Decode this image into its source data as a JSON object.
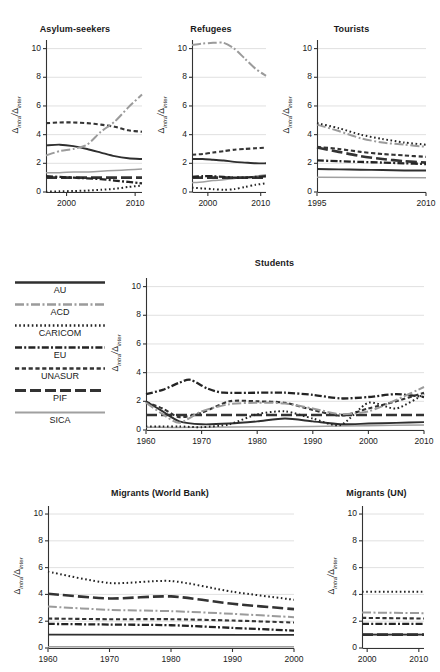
{
  "figure": {
    "ylabel_text": "Δintra/Δinter",
    "ylabel_num": "Δ",
    "ylabel_num_sub": "intra",
    "ylabel_den": "Δ",
    "ylabel_den_sub": "inter",
    "ylabel_slash": "/"
  },
  "legend": {
    "position": "left-middle",
    "items": [
      {
        "label": "AU",
        "style": "solid-dark",
        "color": "#2b2b2b"
      },
      {
        "label": "ACD",
        "style": "dashdot-gray",
        "color": "#9a9a9a"
      },
      {
        "label": "CARICOM",
        "style": "dotted",
        "color": "#2b2b2b"
      },
      {
        "label": "EU",
        "style": "dashdot-dark",
        "color": "#2b2b2b"
      },
      {
        "label": "UNASUR",
        "style": "dashed",
        "color": "#3a3a3a"
      },
      {
        "label": "PIF",
        "style": "longdash",
        "color": "#3a3a3a"
      },
      {
        "label": "SICA",
        "style": "solid-gray",
        "color": "#9a9a9a"
      }
    ]
  },
  "yticks": [
    "0",
    "2",
    "4",
    "6",
    "8",
    "10"
  ],
  "chart_data": [
    {
      "id": "asylum-seekers",
      "type": "line",
      "title": "Asylum-seekers",
      "xlabel": "",
      "ylabel": "Δintra/Δinter",
      "xlim": [
        1997,
        2011
      ],
      "ylim": [
        0,
        10.6
      ],
      "xticks": [
        "2000",
        "2010"
      ],
      "xtick_values": [
        2000,
        2010
      ],
      "yticks": [
        0,
        2,
        4,
        6,
        8,
        10
      ],
      "grid": true,
      "series": [
        {
          "name": "AU",
          "x": [
            1997,
            1999,
            2001,
            2003,
            2005,
            2007,
            2009,
            2011
          ],
          "values": [
            3.25,
            3.3,
            3.2,
            3.0,
            2.75,
            2.5,
            2.35,
            2.3
          ]
        },
        {
          "name": "ACD",
          "x": [
            1997,
            1999,
            2001,
            2003,
            2005,
            2007,
            2009,
            2011
          ],
          "values": [
            2.55,
            2.85,
            3.0,
            3.3,
            4.2,
            4.9,
            5.9,
            6.8
          ]
        },
        {
          "name": "CARICOM",
          "x": [
            1997,
            1999,
            2001,
            2003,
            2005,
            2007,
            2009,
            2011
          ],
          "values": [
            0.02,
            0.05,
            0.07,
            0.1,
            0.15,
            0.22,
            0.35,
            0.45
          ]
        },
        {
          "name": "EU",
          "x": [
            1997,
            1999,
            2001,
            2003,
            2005,
            2007,
            2009,
            2011
          ],
          "values": [
            1.1,
            1.05,
            1.0,
            0.95,
            0.9,
            0.8,
            0.7,
            0.6
          ]
        },
        {
          "name": "UNASUR",
          "x": [
            1997,
            1999,
            2001,
            2003,
            2005,
            2007,
            2009,
            2011
          ],
          "values": [
            4.8,
            4.85,
            4.85,
            4.8,
            4.7,
            4.55,
            4.3,
            4.2
          ]
        },
        {
          "name": "PIF",
          "x": [
            1997,
            2011
          ],
          "values": [
            1.0,
            1.0
          ]
        },
        {
          "name": "SICA",
          "x": [
            1997,
            1999,
            2001,
            2003,
            2005,
            2007,
            2009,
            2011
          ],
          "values": [
            1.35,
            1.35,
            1.4,
            1.4,
            1.45,
            1.5,
            1.55,
            1.6
          ]
        }
      ]
    },
    {
      "id": "refugees",
      "type": "line",
      "title": "Refugees",
      "xlabel": "",
      "ylabel": "Δintra/Δinter",
      "xlim": [
        1997,
        2011
      ],
      "ylim": [
        0,
        10.6
      ],
      "xticks": [
        "2000",
        "2010"
      ],
      "xtick_values": [
        2000,
        2010
      ],
      "yticks": [
        0,
        2,
        4,
        6,
        8,
        10
      ],
      "grid": true,
      "series": [
        {
          "name": "AU",
          "x": [
            1997,
            1999,
            2001,
            2003,
            2005,
            2007,
            2009,
            2011
          ],
          "values": [
            2.3,
            2.3,
            2.25,
            2.2,
            2.1,
            2.05,
            2.0,
            2.0
          ]
        },
        {
          "name": "ACD",
          "x": [
            1997,
            1999,
            2001,
            2003,
            2005,
            2007,
            2009,
            2011
          ],
          "values": [
            10.25,
            10.35,
            10.4,
            10.4,
            10.0,
            9.3,
            8.6,
            8.1
          ]
        },
        {
          "name": "CARICOM",
          "x": [
            1997,
            1999,
            2001,
            2003,
            2005,
            2007,
            2009,
            2011
          ],
          "values": [
            0.3,
            0.25,
            0.2,
            0.15,
            0.2,
            0.35,
            0.5,
            0.6
          ]
        },
        {
          "name": "EU",
          "x": [
            1997,
            1999,
            2001,
            2003,
            2005,
            2007,
            2009,
            2011
          ],
          "values": [
            1.05,
            1.1,
            1.1,
            1.05,
            1.0,
            1.0,
            1.05,
            1.1
          ]
        },
        {
          "name": "UNASUR",
          "x": [
            1997,
            1999,
            2001,
            2003,
            2005,
            2007,
            2009,
            2011
          ],
          "values": [
            2.6,
            2.65,
            2.75,
            2.85,
            2.95,
            3.0,
            3.05,
            3.1
          ]
        },
        {
          "name": "PIF",
          "x": [
            1997,
            2011
          ],
          "values": [
            1.0,
            1.0
          ]
        },
        {
          "name": "SICA",
          "x": [
            1997,
            1999,
            2001,
            2003,
            2005,
            2007,
            2009,
            2011
          ],
          "values": [
            0.65,
            0.7,
            0.8,
            0.85,
            0.95,
            1.0,
            1.1,
            1.2
          ]
        }
      ]
    },
    {
      "id": "tourists",
      "type": "line",
      "title": "Tourists",
      "xlabel": "",
      "ylabel": "Δintra/Δinter",
      "xlim": [
        1995,
        2010
      ],
      "ylim": [
        0,
        10.6
      ],
      "xticks": [
        "1995",
        "2010"
      ],
      "xtick_values": [
        1995,
        2010
      ],
      "yticks": [
        0,
        2,
        4,
        6,
        8,
        10
      ],
      "grid": true,
      "series": [
        {
          "name": "AU",
          "x": [
            1995,
            1998,
            2001,
            2004,
            2007,
            2010
          ],
          "values": [
            1.6,
            1.58,
            1.55,
            1.53,
            1.5,
            1.5
          ]
        },
        {
          "name": "ACD",
          "x": [
            1995,
            1998,
            2001,
            2004,
            2007,
            2010
          ],
          "values": [
            4.7,
            4.25,
            3.75,
            3.45,
            3.3,
            3.15
          ]
        },
        {
          "name": "CARICOM",
          "x": [
            1995,
            1998,
            2001,
            2004,
            2007,
            2010
          ],
          "values": [
            4.8,
            4.45,
            4.0,
            3.7,
            3.45,
            3.3
          ]
        },
        {
          "name": "EU",
          "x": [
            1995,
            1998,
            2001,
            2004,
            2007,
            2010
          ],
          "values": [
            2.2,
            2.15,
            2.1,
            2.05,
            2.0,
            1.95
          ]
        },
        {
          "name": "UNASUR",
          "x": [
            1995,
            1998,
            2001,
            2004,
            2007,
            2010
          ],
          "values": [
            3.15,
            3.0,
            2.8,
            2.65,
            2.55,
            2.45
          ]
        },
        {
          "name": "PIF",
          "x": [
            1995,
            1998,
            2001,
            2004,
            2007,
            2010
          ],
          "values": [
            3.1,
            2.8,
            2.5,
            2.3,
            2.15,
            2.05
          ]
        },
        {
          "name": "SICA",
          "x": [
            1995,
            2010
          ],
          "values": [
            1.02,
            1.0
          ]
        }
      ]
    },
    {
      "id": "students",
      "type": "line",
      "title": "Students",
      "xlabel": "",
      "ylabel": "Δintra/Δinter",
      "xlim": [
        1960,
        2010
      ],
      "ylim": [
        0,
        10.6
      ],
      "xticks": [
        "1960",
        "1970",
        "1980",
        "1990",
        "2000",
        "2010"
      ],
      "xtick_values": [
        1960,
        1970,
        1980,
        1990,
        2000,
        2010
      ],
      "yticks": [
        0,
        2,
        4,
        6,
        8,
        10
      ],
      "grid": true,
      "series": [
        {
          "name": "AU",
          "x": [
            1960,
            1963,
            1966,
            1970,
            1975,
            1980,
            1985,
            1990,
            1995,
            2000,
            2005,
            2010
          ],
          "values": [
            2.0,
            1.3,
            0.6,
            0.4,
            0.45,
            0.6,
            0.8,
            0.6,
            0.4,
            0.45,
            0.5,
            0.55
          ]
        },
        {
          "name": "ACD",
          "x": [
            1960,
            1963,
            1966,
            1970,
            1975,
            1980,
            1985,
            1990,
            1995,
            2000,
            2005,
            2010
          ],
          "values": [
            1.9,
            1.1,
            0.5,
            1.3,
            1.8,
            1.9,
            1.85,
            1.5,
            1.1,
            1.3,
            2.1,
            3.0
          ]
        },
        {
          "name": "CARICOM",
          "x": [
            1960,
            1963,
            1966,
            1970,
            1975,
            1980,
            1985,
            1990,
            1995,
            2000,
            2005,
            2010
          ],
          "values": [
            0.25,
            0.25,
            0.25,
            0.2,
            0.4,
            1.1,
            1.3,
            0.8,
            0.35,
            1.9,
            1.5,
            2.5
          ]
        },
        {
          "name": "EU",
          "x": [
            1960,
            1963,
            1966,
            1968,
            1971,
            1974,
            1980,
            1985,
            1990,
            1995,
            2000,
            2005,
            2010
          ],
          "values": [
            2.5,
            2.8,
            3.3,
            3.5,
            2.9,
            2.6,
            2.6,
            2.6,
            2.45,
            2.2,
            2.3,
            2.5,
            2.3
          ]
        },
        {
          "name": "UNASUR",
          "x": [
            1960,
            1963,
            1966,
            1970,
            1975,
            1980,
            1985,
            1990,
            1995,
            2000,
            2005,
            2010
          ],
          "values": [
            1.95,
            1.5,
            0.9,
            1.2,
            2.0,
            2.0,
            1.9,
            1.4,
            1.0,
            1.5,
            2.0,
            2.6
          ]
        },
        {
          "name": "PIF",
          "x": [
            1960,
            2010
          ],
          "values": [
            1.05,
            1.05
          ]
        },
        {
          "name": "SICA",
          "x": [
            1960,
            1965,
            1970,
            1980,
            1990,
            2000,
            2010
          ],
          "values": [
            0.2,
            0.18,
            0.2,
            0.22,
            0.25,
            0.3,
            0.35
          ]
        }
      ]
    },
    {
      "id": "migrants-world-bank",
      "type": "line",
      "title": "Migrants (World Bank)",
      "xlabel": "",
      "ylabel": "Δintra/Δinter",
      "xlim": [
        1960,
        2000
      ],
      "ylim": [
        0,
        10.6
      ],
      "xticks": [
        "1960",
        "1970",
        "1980",
        "1990",
        "2000"
      ],
      "xtick_values": [
        1960,
        1970,
        1980,
        1990,
        2000
      ],
      "yticks": [
        0,
        2,
        4,
        6,
        8,
        10
      ],
      "grid": true,
      "series": [
        {
          "name": "AU",
          "x": [
            1960,
            2000
          ],
          "values": [
            1.0,
            0.98
          ]
        },
        {
          "name": "ACD",
          "x": [
            1960,
            1970,
            1980,
            1990,
            2000
          ],
          "values": [
            3.1,
            2.85,
            2.75,
            2.55,
            2.3
          ]
        },
        {
          "name": "CARICOM",
          "x": [
            1960,
            1970,
            1980,
            1990,
            2000
          ],
          "values": [
            5.7,
            4.85,
            5.0,
            4.2,
            3.6
          ]
        },
        {
          "name": "EU",
          "x": [
            1960,
            1970,
            1980,
            1990,
            2000
          ],
          "values": [
            1.8,
            1.75,
            1.7,
            1.5,
            1.3
          ]
        },
        {
          "name": "UNASUR",
          "x": [
            1960,
            1970,
            1980,
            1990,
            2000
          ],
          "values": [
            2.2,
            2.15,
            2.15,
            2.05,
            1.9
          ]
        },
        {
          "name": "PIF",
          "x": [
            1960,
            1970,
            1980,
            1990,
            2000
          ],
          "values": [
            4.05,
            3.7,
            3.85,
            3.3,
            2.9
          ]
        },
        {
          "name": "SICA",
          "x": [
            1960,
            2000
          ],
          "values": [
            0.1,
            0.1
          ]
        }
      ]
    },
    {
      "id": "migrants-un",
      "type": "line",
      "title": "Migrants (UN)",
      "xlabel": "",
      "ylabel": "Δintra/Δinter",
      "xlim": [
        1999,
        2011
      ],
      "ylim": [
        0,
        10.6
      ],
      "xticks": [
        "2000",
        "2010"
      ],
      "xtick_values": [
        2000,
        2010
      ],
      "yticks": [
        0,
        2,
        4,
        6,
        8,
        10
      ],
      "grid": true,
      "series": [
        {
          "name": "AU",
          "x": [
            1999,
            2011
          ],
          "values": [
            1.0,
            1.0
          ]
        },
        {
          "name": "ACD",
          "x": [
            1999,
            2011
          ],
          "values": [
            2.65,
            2.6
          ]
        },
        {
          "name": "CARICOM",
          "x": [
            1999,
            2011
          ],
          "values": [
            4.2,
            4.2
          ]
        },
        {
          "name": "EU",
          "x": [
            1999,
            2011
          ],
          "values": [
            1.8,
            1.8
          ]
        },
        {
          "name": "UNASUR",
          "x": [
            1999,
            2011
          ],
          "values": [
            2.25,
            2.2
          ]
        },
        {
          "name": "PIF",
          "x": [
            1999,
            2011
          ],
          "values": [
            1.0,
            1.0
          ]
        },
        {
          "name": "SICA",
          "x": [
            1999,
            2011
          ],
          "values": [
            1.0,
            1.0
          ]
        }
      ]
    }
  ]
}
